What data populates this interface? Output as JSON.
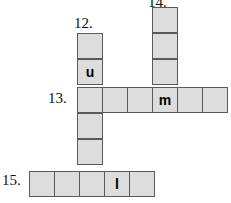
{
  "puzzle": {
    "type": "crossword-fragment",
    "cell_size": 26,
    "colors": {
      "cell_fill": "#dcdcdc",
      "cell_border": "#5a5a5a",
      "background": "#ffffff",
      "text": "#000000"
    },
    "clue_numbers": [
      {
        "id": "clue-12",
        "label": "12.",
        "x": 74,
        "y": 15,
        "direction": "down"
      },
      {
        "id": "clue-14",
        "label": "14.",
        "x": 148,
        "y": -6,
        "direction": "down"
      },
      {
        "id": "clue-13",
        "label": "13.",
        "x": 48,
        "y": 90,
        "direction": "across"
      },
      {
        "id": "clue-15",
        "label": "15.",
        "x": 2,
        "y": 172,
        "direction": "across"
      }
    ],
    "cells": [
      {
        "id": "c12-r1",
        "x": 77,
        "y": 33,
        "letter": ""
      },
      {
        "id": "c12-r2",
        "x": 77,
        "y": 59,
        "letter": "u"
      },
      {
        "id": "c14-r1",
        "x": 152,
        "y": 7,
        "letter": ""
      },
      {
        "id": "c14-r2",
        "x": 152,
        "y": 33,
        "letter": ""
      },
      {
        "id": "c14-r3",
        "x": 152,
        "y": 59,
        "letter": ""
      },
      {
        "id": "r13-c1",
        "x": 77,
        "y": 87,
        "letter": ""
      },
      {
        "id": "r13-c2",
        "x": 102,
        "y": 87,
        "letter": ""
      },
      {
        "id": "r13-c3",
        "x": 127,
        "y": 87,
        "letter": ""
      },
      {
        "id": "r13-c4",
        "x": 152,
        "y": 87,
        "letter": "m"
      },
      {
        "id": "r13-c5",
        "x": 177,
        "y": 87,
        "letter": ""
      },
      {
        "id": "r13-c6",
        "x": 202,
        "y": 87,
        "letter": ""
      },
      {
        "id": "c12-r4",
        "x": 77,
        "y": 113,
        "letter": ""
      },
      {
        "id": "c12-r5",
        "x": 77,
        "y": 139,
        "letter": ""
      },
      {
        "id": "r15-c1",
        "x": 29,
        "y": 171,
        "letter": ""
      },
      {
        "id": "r15-c2",
        "x": 54,
        "y": 171,
        "letter": ""
      },
      {
        "id": "r15-c3",
        "x": 79,
        "y": 171,
        "letter": ""
      },
      {
        "id": "r15-c4",
        "x": 104,
        "y": 171,
        "letter": "l"
      },
      {
        "id": "r15-c5",
        "x": 129,
        "y": 171,
        "letter": ""
      }
    ]
  }
}
